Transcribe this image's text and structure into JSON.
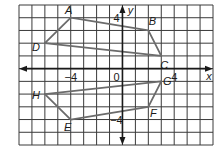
{
  "chart_data": {
    "type": "coordinate-grid",
    "title": "",
    "xlabel": "x",
    "ylabel": "y",
    "xlim": [
      -8,
      7
    ],
    "ylim": [
      -6,
      5
    ],
    "grid": true,
    "tick_labels": {
      "x": [
        {
          "value": -4,
          "label": "−4"
        },
        {
          "value": 4,
          "label": "4"
        }
      ],
      "y": [
        {
          "value": 4,
          "label": "4"
        },
        {
          "value": -4,
          "label": "−4"
        }
      ],
      "origin": "0"
    },
    "polygons": [
      {
        "name": "ABCD",
        "vertices": [
          {
            "label": "A",
            "x": -4,
            "y": 4
          },
          {
            "label": "B",
            "x": 2,
            "y": 3
          },
          {
            "label": "C",
            "x": 3,
            "y": 1
          },
          {
            "label": "D",
            "x": -6,
            "y": 2
          }
        ]
      },
      {
        "name": "EFGH",
        "vertices": [
          {
            "label": "E",
            "x": -4,
            "y": -4
          },
          {
            "label": "F",
            "x": 2,
            "y": -3
          },
          {
            "label": "G",
            "x": 3,
            "y": -1
          },
          {
            "label": "H",
            "x": -6,
            "y": -2
          }
        ]
      }
    ]
  },
  "colors": {
    "grid": "#3a3a3a",
    "polygon": "#6b6b6b",
    "axis": "#1a1a1a"
  }
}
